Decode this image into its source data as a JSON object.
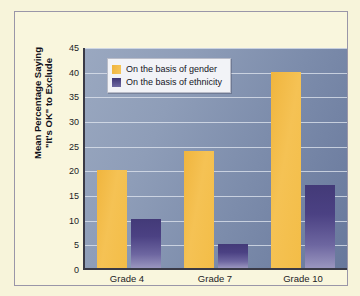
{
  "chart_data": {
    "type": "bar",
    "title": "",
    "subtitle": "",
    "xlabel": "",
    "ylabel": "Mean Percentage Saying \"It's OK\" to Exclude",
    "ylabel_line1": "Mean Percentage Saying",
    "ylabel_line2": "\"It's OK\" to Exclude",
    "categories": [
      "Grade 4",
      "Grade 7",
      "Grade 10"
    ],
    "series": [
      {
        "name": "On the basis of gender",
        "values": [
          20,
          24,
          40
        ],
        "color": "#f2bb4a"
      },
      {
        "name": "On the basis of ethnicity",
        "values": [
          10,
          5,
          17
        ],
        "color": "#4a4184"
      }
    ],
    "ylim": [
      0,
      45
    ],
    "yticks": [
      0,
      5,
      10,
      15,
      20,
      25,
      30,
      35,
      40,
      45
    ],
    "ytick_labels": [
      "0",
      "5",
      "10",
      "15",
      "20",
      "25",
      "30",
      "35",
      "40",
      "45"
    ],
    "grid": true,
    "grid_axis": "y",
    "legend_position": "top-left",
    "plot_background": "blue-gray gradient",
    "figure_background": "#f7f4da"
  },
  "legend": {
    "items": [
      {
        "label": "On the basis of gender",
        "swatch": "gold-swatch-icon"
      },
      {
        "label": "On the basis of ethnicity",
        "swatch": "purple-swatch-icon"
      }
    ]
  }
}
